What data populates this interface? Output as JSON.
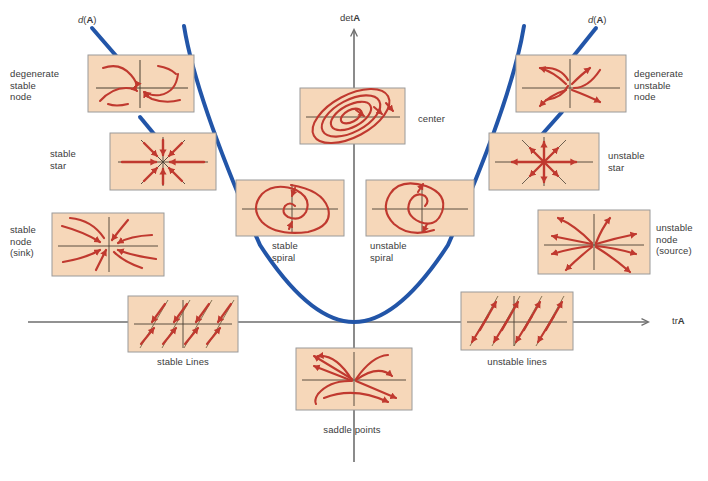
{
  "figure": {
    "background_color": "#ffffff",
    "panel_fill": "#f6d7b9",
    "panel_stroke": "#9a9a9a",
    "flow_color": "#c0392f",
    "axis_color": "#6e6e6e",
    "parabola_color": "#2255a8",
    "text_color": "#3b3b3b"
  },
  "axes": {
    "vertical_label": "det",
    "vertical_label_bold": "A",
    "horizontal_label": "tr",
    "horizontal_label_bold": "A",
    "origin": {
      "x": 354,
      "y": 322
    }
  },
  "discriminant": {
    "left_label_d": "d",
    "left_label_arg": "(",
    "left_label_bold": "A",
    "left_label_close": ")",
    "right_label_d": "d",
    "right_label_arg": "(",
    "right_label_bold": "A",
    "right_label_close": ")",
    "curve": "parabola d(A) = 0"
  },
  "panels": [
    {
      "id": "degenerate-stable-node",
      "label": "degenerate\nstable\nnode",
      "label_side": "left",
      "box": {
        "x": 88,
        "y": 55,
        "w": 106,
        "h": 57
      },
      "label_pos": {
        "x": 10,
        "y": 68
      },
      "portrait": "degenerate-stable-node"
    },
    {
      "id": "stable-star",
      "label": "stable\nstar",
      "label_side": "left",
      "box": {
        "x": 110,
        "y": 133,
        "w": 106,
        "h": 57
      },
      "label_pos": {
        "x": 50,
        "y": 148
      },
      "portrait": "stable-star"
    },
    {
      "id": "stable-node-sink",
      "label": "stable\nnode\n(sink)",
      "label_side": "left",
      "box": {
        "x": 52,
        "y": 213,
        "w": 112,
        "h": 63
      },
      "label_pos": {
        "x": 10,
        "y": 224
      },
      "portrait": "stable-node"
    },
    {
      "id": "stable-lines",
      "label": "stable Lines",
      "label_side": "below",
      "box": {
        "x": 128,
        "y": 296,
        "w": 110,
        "h": 56
      },
      "label_pos": {
        "x": 128,
        "y": 356
      },
      "portrait": "stable-lines"
    },
    {
      "id": "center",
      "label": "center",
      "label_side": "right",
      "box": {
        "x": 300,
        "y": 88,
        "w": 105,
        "h": 56
      },
      "label_pos": {
        "x": 418,
        "y": 113
      },
      "portrait": "center"
    },
    {
      "id": "stable-spiral",
      "label": "stable\nspiral",
      "label_side": "below",
      "box": {
        "x": 236,
        "y": 180,
        "w": 108,
        "h": 56
      },
      "label_pos": {
        "x": 268,
        "y": 240
      },
      "portrait": "stable-spiral"
    },
    {
      "id": "unstable-spiral",
      "label": "unstable\nspiral",
      "label_side": "below",
      "box": {
        "x": 366,
        "y": 180,
        "w": 108,
        "h": 56
      },
      "label_pos": {
        "x": 370,
        "y": 240
      },
      "portrait": "unstable-spiral"
    },
    {
      "id": "saddle-points",
      "label": "saddle points",
      "label_side": "below",
      "box": {
        "x": 296,
        "y": 348,
        "w": 116,
        "h": 62
      },
      "label_pos": {
        "x": 292,
        "y": 424
      },
      "portrait": "saddle"
    },
    {
      "id": "degenerate-unstable-node",
      "label": "degenerate\nunstable\nnode",
      "label_side": "right",
      "box": {
        "x": 516,
        "y": 55,
        "w": 110,
        "h": 57
      },
      "label_pos": {
        "x": 634,
        "y": 68
      },
      "portrait": "degenerate-unstable-node"
    },
    {
      "id": "unstable-star",
      "label": "unstable\nstar",
      "label_side": "right",
      "box": {
        "x": 489,
        "y": 133,
        "w": 110,
        "h": 57
      },
      "label_pos": {
        "x": 608,
        "y": 150
      },
      "portrait": "unstable-star"
    },
    {
      "id": "unstable-node-source",
      "label": "unstable\nnode\n(source)",
      "label_side": "right",
      "box": {
        "x": 538,
        "y": 210,
        "w": 112,
        "h": 64
      },
      "label_pos": {
        "x": 656,
        "y": 222
      },
      "portrait": "unstable-node"
    },
    {
      "id": "unstable-lines",
      "label": "unstable lines",
      "label_side": "below",
      "box": {
        "x": 461,
        "y": 292,
        "w": 112,
        "h": 58
      },
      "label_pos": {
        "x": 458,
        "y": 356
      },
      "portrait": "unstable-lines"
    }
  ]
}
